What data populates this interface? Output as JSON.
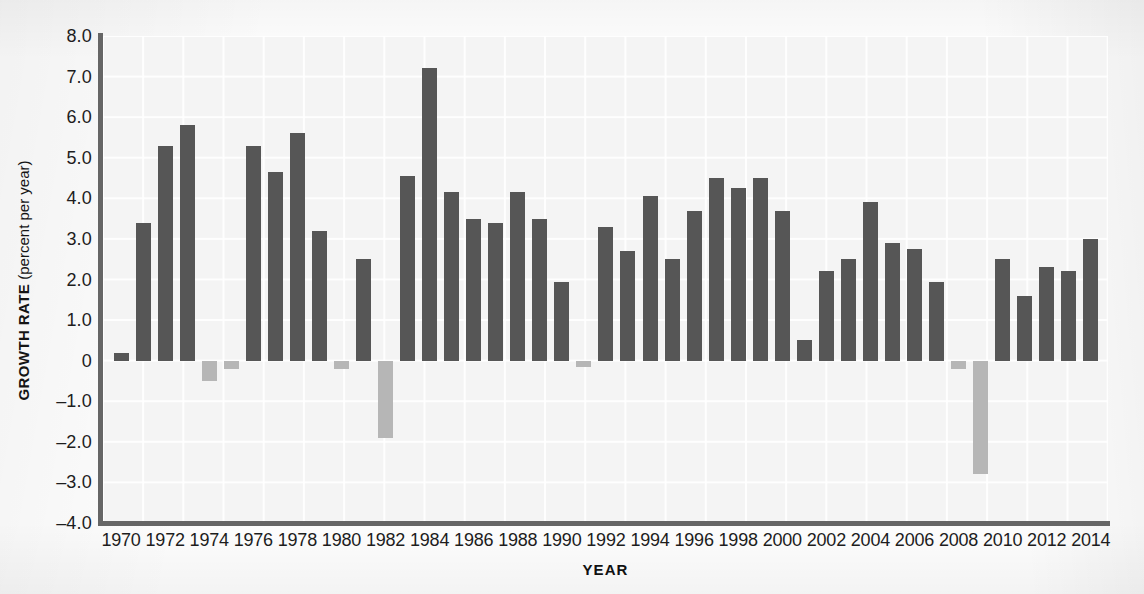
{
  "chart_data": {
    "type": "bar",
    "title": "",
    "xlabel": "YEAR",
    "ylabel": "GROWTH RATE (percent per year)",
    "ylabel_bold_part": "GROWTH RATE",
    "ylabel_plain_part": " (percent per year)",
    "ylim": [
      -4.0,
      8.0
    ],
    "ytick_labels": [
      "8.0",
      "7.0",
      "6.0",
      "5.0",
      "4.0",
      "3.0",
      "2.0",
      "1.0",
      "0",
      "–1.0",
      "–2.0",
      "–3.0",
      "–4.0"
    ],
    "ytick_values": [
      8,
      7,
      6,
      5,
      4,
      3,
      2,
      1,
      0,
      -1,
      -2,
      -3,
      -4
    ],
    "xtick_labels": [
      "1970",
      "1972",
      "1974",
      "1976",
      "1978",
      "1980",
      "1982",
      "1984",
      "1986",
      "1988",
      "1990",
      "1992",
      "1994",
      "1996",
      "1998",
      "2000",
      "2002",
      "2004",
      "2006",
      "2008",
      "2010",
      "2012",
      "2014"
    ],
    "xlim": [
      1969.5,
      2014.5
    ],
    "grid": true,
    "legend": null,
    "colors": {
      "positive_bar": "#565656",
      "negative_bar": "#b6b6b6",
      "axis": "#666666",
      "plot_background": "#f4f4f4",
      "gridline": "#ffffff"
    },
    "categories": [
      1970,
      1971,
      1972,
      1973,
      1974,
      1975,
      1976,
      1977,
      1978,
      1979,
      1980,
      1981,
      1982,
      1983,
      1984,
      1985,
      1986,
      1987,
      1988,
      1989,
      1990,
      1991,
      1992,
      1993,
      1994,
      1995,
      1996,
      1997,
      1998,
      1999,
      2000,
      2001,
      2002,
      2003,
      2004,
      2005,
      2006,
      2007,
      2008,
      2009,
      2010,
      2011,
      2012,
      2013,
      2014
    ],
    "values": [
      0.2,
      3.4,
      5.3,
      5.8,
      -0.5,
      -0.2,
      5.3,
      4.65,
      5.6,
      3.2,
      -0.2,
      2.5,
      -1.9,
      4.55,
      7.2,
      4.15,
      3.5,
      3.4,
      4.15,
      3.5,
      1.95,
      -0.15,
      3.3,
      2.7,
      4.05,
      2.5,
      3.7,
      4.5,
      4.25,
      4.5,
      3.7,
      0.5,
      2.2,
      2.5,
      3.9,
      2.9,
      2.75,
      1.95,
      -0.2,
      -2.8,
      2.5,
      1.6,
      2.3,
      2.2,
      3.0
    ]
  }
}
